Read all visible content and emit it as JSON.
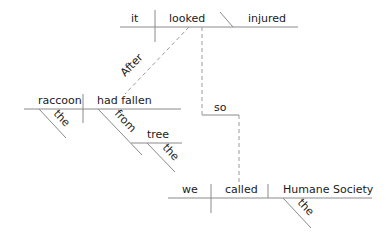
{
  "diagram": {
    "type": "sentence-diagram",
    "clauses": {
      "main_clause_1": {
        "subject": "it",
        "verb": "looked",
        "complement": "injured"
      },
      "subordinate_clause": {
        "conjunction": "After",
        "subject": "raccoon",
        "subject_modifier": "the",
        "verb": "had fallen",
        "preposition": "from",
        "object_of_preposition": "tree",
        "object_modifier": "the"
      },
      "main_clause_2": {
        "conjunction": "so",
        "subject": "we",
        "verb": "called",
        "direct_object": "Humane Society",
        "object_modifier": "the"
      }
    }
  }
}
